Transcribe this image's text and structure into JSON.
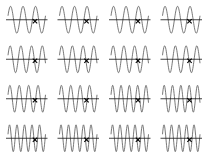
{
  "chart_data": {
    "type": "line",
    "title": "",
    "layout": {
      "rows": 4,
      "cols": 4,
      "grid": false,
      "legend": "none"
    },
    "colors": {
      "wave": "#555555",
      "axis": "#111111",
      "marker": "#000000",
      "background": "#ffffff"
    },
    "panels": [
      {
        "row": 0,
        "col": 0,
        "cycles": 3.0,
        "marker_x": 0.72
      },
      {
        "row": 0,
        "col": 1,
        "cycles": 3.0,
        "marker_x": 0.72
      },
      {
        "row": 0,
        "col": 2,
        "cycles": 3.0,
        "marker_x": 0.72
      },
      {
        "row": 0,
        "col": 3,
        "cycles": 3.0,
        "marker_x": 0.72
      },
      {
        "row": 1,
        "col": 0,
        "cycles": 3.5,
        "marker_x": 0.72
      },
      {
        "row": 1,
        "col": 1,
        "cycles": 3.5,
        "marker_x": 0.72
      },
      {
        "row": 1,
        "col": 2,
        "cycles": 3.5,
        "marker_x": 0.72
      },
      {
        "row": 1,
        "col": 3,
        "cycles": 3.5,
        "marker_x": 0.72
      },
      {
        "row": 2,
        "col": 0,
        "cycles": 4.0,
        "marker_x": 0.72
      },
      {
        "row": 2,
        "col": 1,
        "cycles": 4.0,
        "marker_x": 0.72
      },
      {
        "row": 2,
        "col": 2,
        "cycles": 4.5,
        "marker_x": 0.72
      },
      {
        "row": 2,
        "col": 3,
        "cycles": 4.5,
        "marker_x": 0.72
      },
      {
        "row": 3,
        "col": 0,
        "cycles": 5.0,
        "marker_x": 0.72
      },
      {
        "row": 3,
        "col": 1,
        "cycles": 5.0,
        "marker_x": 0.72
      },
      {
        "row": 3,
        "col": 2,
        "cycles": 5.0,
        "marker_x": 0.72
      },
      {
        "row": 3,
        "col": 3,
        "cycles": 5.0,
        "marker_x": 0.72
      }
    ],
    "marker_label": "x",
    "xlabel": "",
    "ylabel": ""
  }
}
